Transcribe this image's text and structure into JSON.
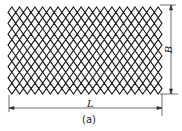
{
  "figure": {
    "caption": "(a)",
    "dimensions": {
      "length_label": "L",
      "width_label": "B"
    },
    "mesh": {
      "columns": 20,
      "rows": 8,
      "stroke_color": "#1a1a1a"
    }
  }
}
